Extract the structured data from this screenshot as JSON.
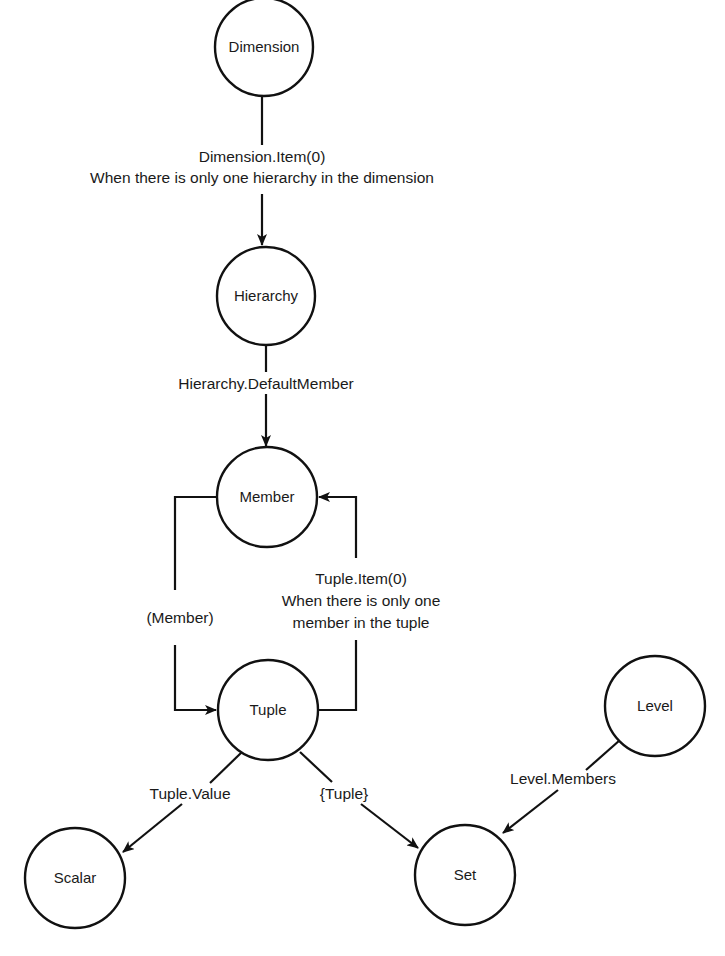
{
  "diagram": {
    "type": "object-conversion-graph",
    "nodes": {
      "dimension": {
        "label": "Dimension",
        "cx": 264,
        "cy": 47,
        "r": 49
      },
      "hierarchy": {
        "label": "Hierarchy",
        "cx": 266,
        "cy": 296,
        "r": 49
      },
      "member": {
        "label": "Member",
        "cx": 267,
        "cy": 497,
        "r": 50
      },
      "tuple": {
        "label": "Tuple",
        "cx": 268,
        "cy": 710,
        "r": 50
      },
      "level": {
        "label": "Level",
        "cx": 655,
        "cy": 706,
        "r": 50
      },
      "scalar": {
        "label": "Scalar",
        "cx": 75,
        "cy": 878,
        "r": 50
      },
      "set": {
        "label": "Set",
        "cx": 465,
        "cy": 875,
        "r": 50
      }
    },
    "edges": {
      "dimension_to_hierarchy": {
        "from": "Dimension",
        "to": "Hierarchy",
        "line1": "Dimension.Item(0)",
        "line2": "When there is only one hierarchy in the dimension"
      },
      "hierarchy_to_member": {
        "from": "Hierarchy",
        "to": "Member",
        "line1": "Hierarchy.DefaultMember"
      },
      "member_to_tuple": {
        "from": "Member",
        "to": "Tuple",
        "line1": "(Member)"
      },
      "tuple_to_member": {
        "from": "Tuple",
        "to": "Member",
        "line1": "Tuple.Item(0)",
        "line2": "When there is only one",
        "line3": "member in the tuple"
      },
      "tuple_to_scalar": {
        "from": "Tuple",
        "to": "Scalar",
        "line1": "Tuple.Value"
      },
      "tuple_to_set": {
        "from": "Tuple",
        "to": "Set",
        "line1": "{Tuple}"
      },
      "level_to_set": {
        "from": "Level",
        "to": "Set",
        "line1": "Level.Members"
      }
    },
    "colors": {
      "stroke": "#111111",
      "background": "#ffffff",
      "text": "#1a1a1a"
    }
  }
}
